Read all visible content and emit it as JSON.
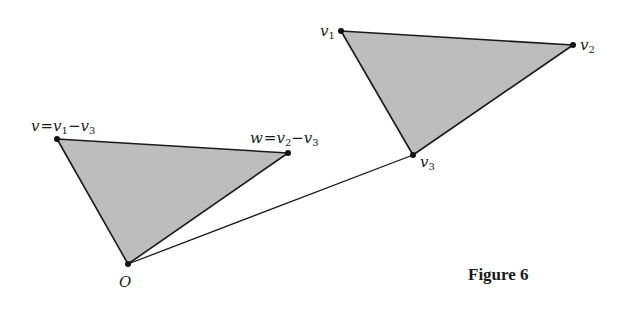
{
  "figure": {
    "caption": "Figure 6",
    "colors": {
      "fill": "#bdbdbd",
      "stroke": "#1a1a1a",
      "background": "#ffffff"
    },
    "triangles": [
      {
        "name": "translated-triangle",
        "vertices": [
          {
            "id": "v",
            "x": 57,
            "y": 139,
            "label_main": "v",
            "label_expr": "=v",
            "sub1": "1",
            "minus": "−v",
            "sub2": "3"
          },
          {
            "id": "w",
            "x": 288,
            "y": 153,
            "label_main": "w",
            "label_expr": "=v",
            "sub1": "2",
            "minus": "−v",
            "sub2": "3"
          },
          {
            "id": "O",
            "x": 128,
            "y": 264,
            "label": "O"
          }
        ]
      },
      {
        "name": "original-triangle",
        "vertices": [
          {
            "id": "v1",
            "x": 341,
            "y": 31,
            "label": "v",
            "sub": "1"
          },
          {
            "id": "v2",
            "x": 573,
            "y": 45,
            "label": "v",
            "sub": "2"
          },
          {
            "id": "v3",
            "x": 413,
            "y": 155,
            "label": "v",
            "sub": "3"
          }
        ]
      }
    ],
    "segments": [
      {
        "name": "origin-to-v3",
        "from": "O",
        "to": "v3"
      }
    ]
  }
}
